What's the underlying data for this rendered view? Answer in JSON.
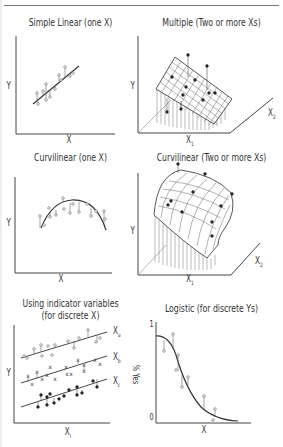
{
  "figure": {
    "panels": [
      {
        "id": "simple-linear",
        "title": "Simple Linear (one X)",
        "y_label": "Y",
        "x_label": "X"
      },
      {
        "id": "multiple",
        "title": "Multiple (Two or more Xs)",
        "y_label": "Y",
        "x1_label": "X",
        "x1_sub": "1",
        "x2_label": "X",
        "x2_sub": "2"
      },
      {
        "id": "curvilinear-one",
        "title": "Curvilinear (one X)",
        "y_label": "Y",
        "x_label": "X"
      },
      {
        "id": "curvilinear-multi",
        "title": "Curvilinear (Two or more Xs)",
        "y_label": "Y",
        "x1_label": "X",
        "x1_sub": "1",
        "x2_label": "X",
        "x2_sub": "2"
      },
      {
        "id": "indicator",
        "title_line1": "Using indicator variables",
        "title_line2": "(for discrete X)",
        "y_label": "Y",
        "x_label": "X",
        "x_sub": "i",
        "series_labels": [
          {
            "t": "X",
            "s": "a"
          },
          {
            "t": "X",
            "s": "b"
          },
          {
            "t": "X",
            "s": "c"
          }
        ]
      },
      {
        "id": "logistic",
        "title": "Logistic (for discrete Ys)",
        "y_label": "% Yes",
        "x_label": "X",
        "y_tick_top": "1",
        "y_tick_bottom": "0"
      }
    ]
  },
  "colors": {
    "line": "#333333",
    "axis": "#444444",
    "surface": "#555555",
    "bg": "#ffffff"
  }
}
